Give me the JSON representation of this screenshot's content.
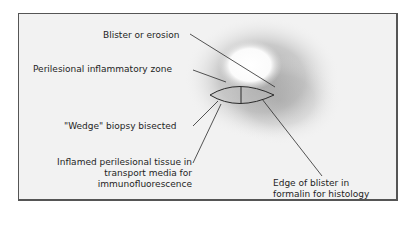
{
  "diagram": {
    "type": "medical-illustration",
    "labels": {
      "blister": "Blister or erosion",
      "perilesional_zone": "Perilesional inflammatory zone",
      "wedge": "\"Wedge\" biopsy bisected",
      "inflamed_line1": "Inflamed perilesional tissue in",
      "inflamed_line2": "transport media for",
      "inflamed_line3": "immunofluorescence",
      "edge_line1": "Edge of blister in",
      "edge_line2": "formalin for histology"
    },
    "colors": {
      "background": "#f2f2f2",
      "frame": "#555555",
      "halo": "#9a9a9a",
      "blister_center": "#ffffff",
      "lines": "#2a2a2a"
    }
  }
}
